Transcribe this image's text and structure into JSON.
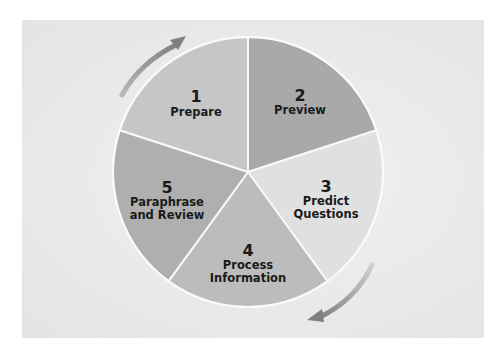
{
  "diagram": {
    "type": "cycle-pie",
    "slices": [
      {
        "number": "1",
        "lines": [
          "Prepare"
        ],
        "color": "#c6c6c6"
      },
      {
        "number": "2",
        "lines": [
          "Preview"
        ],
        "color": "#a9a9a9"
      },
      {
        "number": "3",
        "lines": [
          "Predict",
          "Questions"
        ],
        "color": "#e0e0e0"
      },
      {
        "number": "4",
        "lines": [
          "Process",
          "Information"
        ],
        "color": "#bcbcbc"
      },
      {
        "number": "5",
        "lines": [
          "Paraphrase",
          "and Review"
        ],
        "color": "#afafaf"
      }
    ],
    "arrows": [
      {
        "position": "top-left",
        "direction": "clockwise"
      },
      {
        "position": "bottom-right",
        "direction": "clockwise"
      }
    ],
    "colors": {
      "panel": "#e8e8e8",
      "divider": "#f8f8f8",
      "arrow": "#8f8f8f"
    }
  }
}
